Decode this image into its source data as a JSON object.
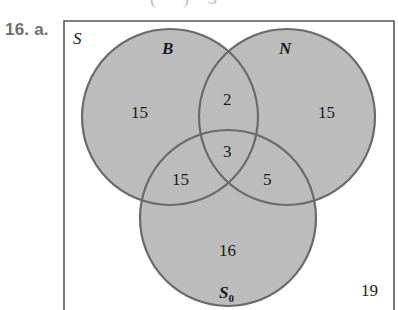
{
  "header": {
    "top_cut_text": "(· · ·) = 3",
    "problem_label": "16. a."
  },
  "diagram": {
    "universe_label": "S",
    "colors": {
      "fill": "#bcbcbc",
      "stroke": "#6a6a6a",
      "box": "#555555",
      "text": "#1a1a1a"
    },
    "sets": {
      "B": {
        "label": "B",
        "cx": 170,
        "cy": 117,
        "r": 88
      },
      "N": {
        "label": "N",
        "cx": 287,
        "cy": 117,
        "r": 88
      },
      "S0": {
        "label": "S",
        "subscript": "0",
        "cx": 228,
        "cy": 218,
        "r": 88
      }
    },
    "regions": {
      "B_only": "15",
      "N_only": "15",
      "S0_only": "16",
      "B_and_N_only": "2",
      "B_and_S0_only": "15",
      "N_and_S0_only": "5",
      "B_and_N_and_S0": "3",
      "outside": "19"
    }
  }
}
